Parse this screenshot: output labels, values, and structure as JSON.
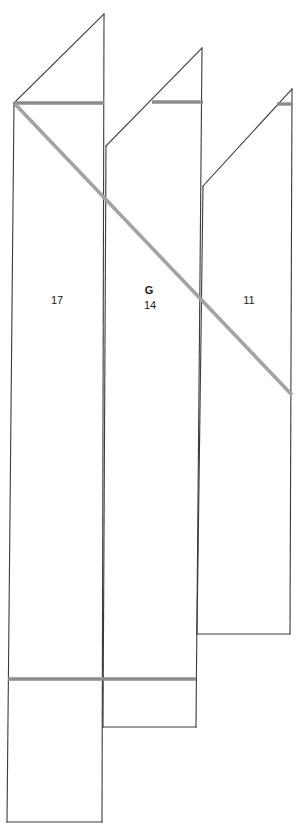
{
  "diagram": {
    "background_color": "#ffffff",
    "stroke_color": "#3b3b3b",
    "accent_gray": "#8c8c8c",
    "diagonal_gray": "#a3a3a3",
    "labels": [
      {
        "id": "panel-1-number",
        "text": "17",
        "x": 57,
        "y": 304,
        "bold": false
      },
      {
        "id": "panel-2-letter",
        "text": "G",
        "x": 149,
        "y": 294,
        "bold": true
      },
      {
        "id": "panel-2-number",
        "text": "14",
        "x": 150,
        "y": 309,
        "bold": false
      },
      {
        "id": "panel-3-number",
        "text": "11",
        "x": 249,
        "y": 304,
        "bold": false
      }
    ],
    "panels": [
      {
        "id": "panel-1",
        "label": "17",
        "outline": "14,103 104,14 104,145 104,822 7,822 7,103",
        "apex": {
          "x": 104,
          "y": 14
        },
        "ridge_line": {
          "x1": 14,
          "y1": 103,
          "x2": 104,
          "y2": 103
        }
      },
      {
        "id": "panel-2",
        "label": "14",
        "outline": "106,146 202,48 202,727 106,727",
        "apex": {
          "x": 202,
          "y": 48
        },
        "ridge_line": {
          "x1": 152,
          "y1": 102,
          "x2": 203,
          "y2": 102
        }
      },
      {
        "id": "panel-3",
        "label": "11",
        "outline": "203,186 292,89 292,634 203,634",
        "apex": {
          "x": 292,
          "y": 89
        },
        "ridge_line": {
          "x1": 277,
          "y1": 104,
          "x2": 293,
          "y2": 104
        }
      }
    ],
    "gray_segments": [
      {
        "id": "ridge-1",
        "x1": 14,
        "y1": 103,
        "x2": 104,
        "y2": 103
      },
      {
        "id": "ridge-2",
        "x1": 152,
        "y1": 102,
        "x2": 203,
        "y2": 102
      },
      {
        "id": "ridge-3",
        "x1": 277,
        "y1": 104,
        "x2": 293,
        "y2": 104
      },
      {
        "id": "base-line",
        "x1": 8,
        "y1": 679,
        "x2": 196,
        "y2": 679
      }
    ],
    "gray_diagonal": {
      "id": "section-cut",
      "x1": 15,
      "y1": 104,
      "x2": 292,
      "y2": 395
    }
  }
}
